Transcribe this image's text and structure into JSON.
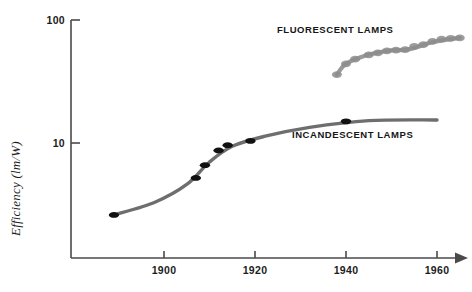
{
  "chart_data": {
    "type": "line",
    "title": "",
    "subtitle": "",
    "xlabel": "",
    "ylabel": "Efficiency (lm/W)",
    "y_scale": "log",
    "ylim": [
      1,
      100
    ],
    "xlim": [
      1884,
      1968
    ],
    "grid": false,
    "legend_position": "inline-annotation",
    "x_ticks": [
      1900,
      1920,
      1940,
      1960
    ],
    "x_tick_labels": [
      "1900",
      "1920",
      "1940",
      "1960"
    ],
    "y_ticks": [
      10,
      100
    ],
    "y_tick_labels": [
      "10",
      "100"
    ],
    "x_axis_arrow": true,
    "annotations": [
      {
        "text": "FLUORESCENT LAMPS",
        "x": 1938,
        "y": 52
      },
      {
        "text": "INCANDESCENT LAMPS",
        "x": 1940,
        "y": 13.5
      }
    ],
    "series": [
      {
        "name": "INCANDESCENT LAMPS",
        "color": "#6e6e6e",
        "marker_color": "#111111",
        "points": [
          {
            "x": 1889,
            "y": 2.6
          },
          {
            "x": 1907,
            "y": 5.2
          },
          {
            "x": 1909,
            "y": 6.6
          },
          {
            "x": 1912,
            "y": 8.7
          },
          {
            "x": 1914,
            "y": 9.6
          },
          {
            "x": 1919,
            "y": 10.4
          },
          {
            "x": 1940,
            "y": 15.0
          }
        ],
        "line_points": [
          {
            "x": 1889,
            "y": 2.6
          },
          {
            "x": 1898,
            "y": 3.3
          },
          {
            "x": 1905,
            "y": 4.6
          },
          {
            "x": 1910,
            "y": 7.0
          },
          {
            "x": 1915,
            "y": 9.4
          },
          {
            "x": 1922,
            "y": 11.3
          },
          {
            "x": 1932,
            "y": 13.4
          },
          {
            "x": 1945,
            "y": 15.2
          },
          {
            "x": 1960,
            "y": 15.4
          }
        ]
      },
      {
        "name": "FLUORESCENT LAMPS",
        "color": "#9a9a9a",
        "marker_color": "#8c8c8c",
        "points": [
          {
            "x": 1938,
            "y": 36.0
          },
          {
            "x": 1940,
            "y": 44.0
          },
          {
            "x": 1942,
            "y": 48.0
          },
          {
            "x": 1945,
            "y": 52.0
          },
          {
            "x": 1947,
            "y": 54.0
          },
          {
            "x": 1949,
            "y": 56.0
          },
          {
            "x": 1951,
            "y": 57.0
          },
          {
            "x": 1953,
            "y": 57.5
          },
          {
            "x": 1955,
            "y": 61.0
          },
          {
            "x": 1957,
            "y": 63.0
          },
          {
            "x": 1959,
            "y": 67.0
          },
          {
            "x": 1961,
            "y": 70.0
          },
          {
            "x": 1963,
            "y": 71.0
          },
          {
            "x": 1965,
            "y": 71.5
          }
        ],
        "line_points": [
          {
            "x": 1938,
            "y": 36.0
          },
          {
            "x": 1940,
            "y": 44.0
          },
          {
            "x": 1944,
            "y": 51.0
          },
          {
            "x": 1949,
            "y": 56.0
          },
          {
            "x": 1954,
            "y": 58.0
          },
          {
            "x": 1959,
            "y": 66.0
          },
          {
            "x": 1965,
            "y": 71.5
          }
        ]
      }
    ]
  },
  "axis": {
    "y_top_label": "100",
    "y_mid_label": "10",
    "y_title": "Efficiency (lm/W)",
    "x_labels": [
      "1900",
      "1920",
      "1940",
      "1960"
    ]
  },
  "labels": {
    "fluorescent": "FLUORESCENT LAMPS",
    "incandescent": "INCANDESCENT LAMPS"
  },
  "colors": {
    "axis": "#4a4a4a",
    "incandescent_line": "#6e6e6e",
    "incandescent_marker": "#111111",
    "fluorescent_line": "#9e9e9e",
    "fluorescent_marker": "#8c8c8c",
    "text": "#1c1c1c",
    "background": "#ffffff"
  }
}
